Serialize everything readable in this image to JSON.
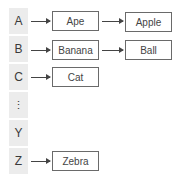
{
  "index_column": [
    {
      "label": "A"
    },
    {
      "label": "B"
    },
    {
      "label": "C"
    },
    {
      "label": "⋮"
    },
    {
      "label": "Y"
    },
    {
      "label": "Z"
    }
  ],
  "chains": {
    "A": [
      "Ape",
      "Apple"
    ],
    "B": [
      "Banana",
      "Ball"
    ],
    "C": [
      "Cat"
    ],
    "Z": [
      "Zebra"
    ]
  },
  "colors": {
    "cell_bg": "#ececec",
    "box_border": "#6a6a6a",
    "arrow": "#444444"
  }
}
